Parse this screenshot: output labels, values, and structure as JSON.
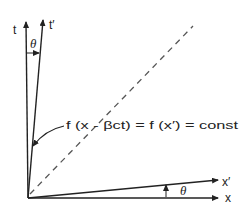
{
  "diagram": {
    "title": "",
    "axes": {
      "t_label": "t",
      "t_prime_label": "t′",
      "x_label": "x",
      "x_prime_label": "x′"
    },
    "angles": {
      "upper_theta": "θ",
      "lower_theta": "θ"
    },
    "annotation": "f (x - βct) = f (x′) = const",
    "colors": {
      "ink": "#222222",
      "background": "#ffffff"
    }
  }
}
